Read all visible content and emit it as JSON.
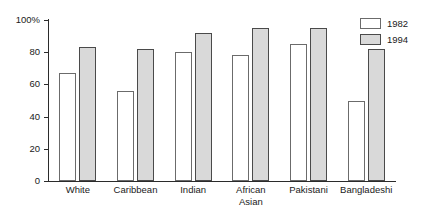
{
  "chart_data": {
    "type": "bar",
    "title": "",
    "subtitle": "",
    "xlabel": "",
    "ylabel": "",
    "ylim": [
      0,
      100
    ],
    "yticks": [
      0,
      20,
      40,
      60,
      80,
      100
    ],
    "ytick_labels": [
      "0",
      "20",
      "40",
      "60",
      "80",
      "100%"
    ],
    "grid": false,
    "legend_position": "top-right",
    "categories": [
      "White",
      "Caribbean",
      "Indian",
      "African\nAsian",
      "Pakistani",
      "Bangladeshi"
    ],
    "series": [
      {
        "name": "1982",
        "color": "#ffffff",
        "values": [
          67,
          56,
          80,
          78,
          85,
          50
        ]
      },
      {
        "name": "1994",
        "color": "#d9d9d9",
        "values": [
          83,
          82,
          92,
          95,
          95,
          82
        ]
      }
    ]
  },
  "legend": {
    "entries": [
      {
        "label": "1982"
      },
      {
        "label": "1994"
      }
    ]
  }
}
